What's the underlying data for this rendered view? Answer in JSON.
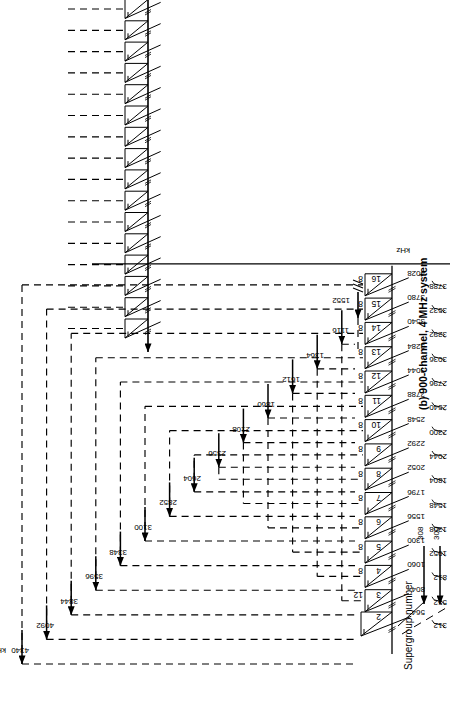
{
  "figure": {
    "caption": "(b) 900-channel, 4 MHz system",
    "axis_label": "Supergroup number",
    "unit_left": "kHz",
    "unit_right": "kHz",
    "unit_bottom": "kHz",
    "baseband_range": [
      "312",
      "552"
    ],
    "special_arrow_label": "1552",
    "low_arrows": [
      "308",
      "300"
    ],
    "line_color": "#000000",
    "dash_color": "#1a1a1a"
  },
  "chart_data": {
    "type": "diagram",
    "title": "(b) 900-channel, 4 MHz system",
    "xlabel": "Supergroup number",
    "ylabel": "kHz",
    "supergroups": [
      {
        "number": "2",
        "group_count": "",
        "low": "312",
        "high": "564"
      },
      {
        "number": "3",
        "group_count": "12",
        "low": "552",
        "high": "804"
      },
      {
        "number": "4",
        "group_count": "8",
        "low": "812",
        "high": "1060"
      },
      {
        "number": "5",
        "group_count": "8",
        "low": "1052",
        "high": "1300"
      },
      {
        "number": "6",
        "group_count": "8",
        "low": "1308",
        "high": "1556"
      },
      {
        "number": "7",
        "group_count": "8",
        "low": "1548",
        "high": "1796"
      },
      {
        "number": "8",
        "group_count": "8",
        "low": "1804",
        "high": "2052"
      },
      {
        "number": "9",
        "group_count": "8",
        "low": "2044",
        "high": "2292"
      },
      {
        "number": "10",
        "group_count": "8",
        "low": "2300",
        "high": "2548"
      },
      {
        "number": "11",
        "group_count": "8",
        "low": "2540",
        "high": "2788"
      },
      {
        "number": "12",
        "group_count": "8",
        "low": "2796",
        "high": "3044"
      },
      {
        "number": "13",
        "group_count": "8",
        "low": "3036",
        "high": "3284"
      },
      {
        "number": "14",
        "group_count": "8",
        "low": "3292",
        "high": "3540"
      },
      {
        "number": "15",
        "group_count": "8",
        "low": "3532",
        "high": "3780"
      },
      {
        "number": "16",
        "group_count": "8",
        "low": "3788",
        "high": "4028"
      }
    ],
    "carrier_frequencies": [
      "4340",
      "4092",
      "3844",
      "3596",
      "3348",
      "3100",
      "2852",
      "2604",
      "2356",
      "2108",
      "1860",
      "1612",
      "1364",
      "1116"
    ],
    "carrier_unit": "kHz",
    "extra_carriers": [
      "1552",
      "308",
      "300"
    ],
    "baseband_low": "312",
    "baseband_high": "552",
    "baseband_unit": "kHz"
  }
}
